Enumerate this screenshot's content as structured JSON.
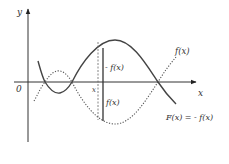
{
  "diagram": {
    "axes": {
      "y_label": "y",
      "x_label": "x",
      "origin_label": "0"
    },
    "curves": {
      "f": {
        "label": "f(x)",
        "style": "dotted",
        "color": "#555555"
      },
      "F": {
        "label": "F(x) = - f(x)",
        "style": "solid",
        "color": "#444444"
      }
    },
    "marker": {
      "x_label": "x",
      "upper_segment_label": "- f(x)",
      "lower_segment_label": "f(x)"
    }
  }
}
